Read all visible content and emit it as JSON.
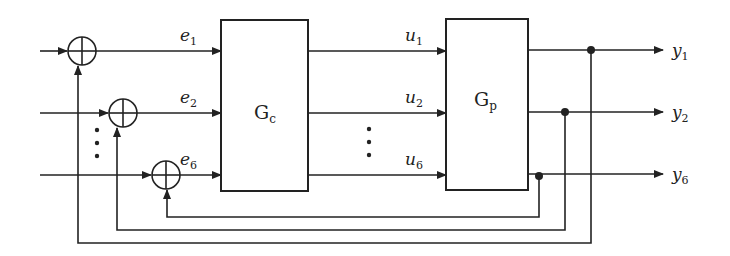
{
  "diagram": {
    "type": "block-diagram",
    "blocks": [
      {
        "id": "controller",
        "label": "G",
        "subscript": "c"
      },
      {
        "id": "plant",
        "label": "G",
        "subscript": "p"
      }
    ],
    "error_signals": [
      {
        "label": "e",
        "subscript": "1"
      },
      {
        "label": "e",
        "subscript": "2"
      },
      {
        "label": "e",
        "subscript": "6"
      }
    ],
    "control_signals": [
      {
        "label": "u",
        "subscript": "1"
      },
      {
        "label": "u",
        "subscript": "2"
      },
      {
        "label": "u",
        "subscript": "6"
      }
    ],
    "outputs": [
      {
        "label": "y",
        "subscript": "1"
      },
      {
        "label": "y",
        "subscript": "2"
      },
      {
        "label": "y",
        "subscript": "6"
      }
    ],
    "summing_junctions": 3,
    "ellipsis": "⋮"
  }
}
